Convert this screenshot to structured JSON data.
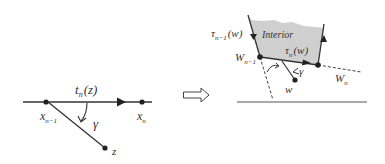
{
  "left_diagram": {
    "curve_label": "t",
    "curve_label_sub": "n",
    "curve_label_arg": "(z)",
    "point_start": "x",
    "point_start_sub": "n−1",
    "point_end": "x",
    "point_end_sub": "n",
    "point_z": "z",
    "angle": "γ"
  },
  "transform_arrow": "implies-arrow-icon",
  "right_diagram": {
    "region_label": "Interior",
    "tau_prev": "τ",
    "tau_prev_sub": "n−1",
    "tau_prev_arg": "(w)",
    "tau_cur": "τ",
    "tau_cur_sub": "n",
    "tau_cur_arg": "(w)",
    "vertex_prev": "W",
    "vertex_prev_sub": "n−1",
    "vertex_cur": "W",
    "vertex_cur_sub": "n",
    "point_w": "w",
    "angle": "γ"
  },
  "colors": {
    "stroke": "#333333",
    "interior_fill": "#cfcfcf"
  }
}
